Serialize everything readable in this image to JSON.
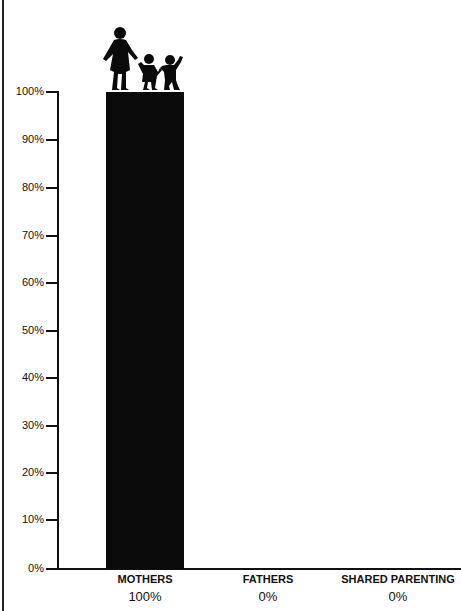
{
  "chart_data": {
    "type": "bar",
    "title": "",
    "categories": [
      "MOTHERS",
      "FATHERS",
      "SHARED PARENTING"
    ],
    "values": [
      100,
      0,
      0
    ],
    "value_labels": [
      "100%",
      "0%",
      "0%"
    ],
    "xlabel": "",
    "ylabel": "",
    "ylim": [
      0,
      100
    ],
    "y_ticks": [
      "0%",
      "10%",
      "20%",
      "30%",
      "40%",
      "50%",
      "60%",
      "70%",
      "80%",
      "90%",
      "100%"
    ],
    "grid": false,
    "legend": null,
    "bar_color": "#0a0a0a",
    "annotations": [
      "silhouette of mother holding hands with two children atop the MOTHERS bar"
    ]
  },
  "axis": {
    "ticks": [
      {
        "label": "100%",
        "y": 92
      },
      {
        "label": "90%",
        "y": 140
      },
      {
        "label": "80%",
        "y": 188
      },
      {
        "label": "70%",
        "y": 236
      },
      {
        "label": "60%",
        "y": 283
      },
      {
        "label": "50%",
        "y": 331
      },
      {
        "label": "40%",
        "y": 378
      },
      {
        "label": "30%",
        "y": 426
      },
      {
        "label": "20%",
        "y": 473
      },
      {
        "label": "10%",
        "y": 520
      },
      {
        "label": "0%",
        "y": 569
      }
    ]
  },
  "bars": [
    {
      "category": "MOTHERS",
      "value_label": "100%"
    },
    {
      "category": "FATHERS",
      "value_label": "0%"
    },
    {
      "category": "SHARED PARENTING",
      "value_label": "0%"
    }
  ]
}
